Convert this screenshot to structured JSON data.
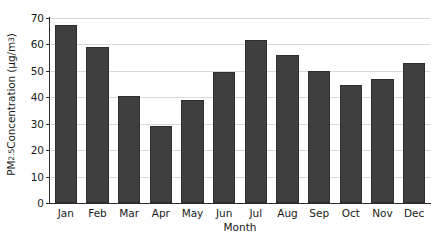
{
  "chart_data": {
    "type": "bar",
    "title": "",
    "categories": [
      "Jan",
      "Feb",
      "Mar",
      "Apr",
      "May",
      "Jun",
      "Jul",
      "Aug",
      "Sep",
      "Oct",
      "Nov",
      "Dec"
    ],
    "values": [
      67.5,
      59,
      40.5,
      29,
      39,
      49.5,
      61.5,
      56,
      50,
      44.5,
      47,
      53
    ],
    "series": [
      {
        "name": "PM2.5 Concentration",
        "values": [
          67.5,
          59,
          40.5,
          29,
          39,
          49.5,
          61.5,
          56,
          50,
          44.5,
          47,
          53
        ]
      }
    ],
    "xlabel": "Month",
    "ylabel": "PM2.5 Concentration (µg/m3)",
    "ylabel_parts": {
      "prefix": "PM",
      "subscript": "2.5",
      "middle": " Concentration (µg/m",
      "superscript": "3",
      "suffix": ")"
    },
    "ylim": [
      0,
      70
    ],
    "yticks": [
      0,
      10,
      20,
      30,
      40,
      50,
      60,
      70
    ],
    "ytick_labels": [
      "0",
      "10",
      "20",
      "30",
      "40",
      "50",
      "60",
      "70"
    ],
    "xticks": [
      "Jan",
      "Feb",
      "Mar",
      "Apr",
      "May",
      "Jun",
      "Jul",
      "Aug",
      "Sep",
      "Oct",
      "Nov",
      "Dec"
    ],
    "grid": true,
    "grid_axis": "y",
    "legend": false,
    "legend_position": "none",
    "bar_color": "#3f3f3f",
    "bar_edge_color": "#2e2e2e",
    "gridline_color": "#d8d8d8",
    "axis_color": "#2b2b2b",
    "background_color": "#ffffff"
  }
}
